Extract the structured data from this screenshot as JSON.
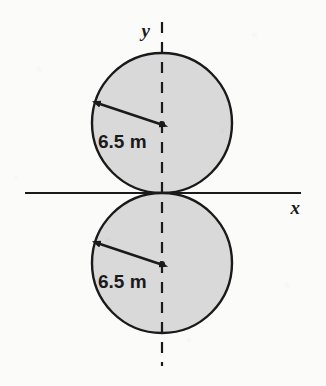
{
  "figure": {
    "background_color": "#fbfbfa",
    "stroke_color": "#1a1a1a",
    "fill_color": "#d9d9d9",
    "axes": {
      "x_label": "x",
      "y_label": "y",
      "x_axis": {
        "x1": 25,
        "y1": 193,
        "x2": 301,
        "y2": 193,
        "style": "solid"
      },
      "y_axis": {
        "x1": 162,
        "y1": 22,
        "x2": 162,
        "y2": 366,
        "style": "dashed"
      },
      "x_label_pos": {
        "x": 300,
        "y": 214
      },
      "y_label_pos": {
        "x": 150,
        "y": 37
      }
    },
    "circles": [
      {
        "id": "upper-circle",
        "cx": 162,
        "cy": 123,
        "r": 70,
        "radius_label": "6.5 m",
        "label_pos": {
          "x": 98,
          "y": 148
        },
        "arrow": {
          "x1": 100,
          "y1": 104,
          "x2": 160,
          "y2": 124
        }
      },
      {
        "id": "lower-circle",
        "cx": 162,
        "cy": 263,
        "r": 70,
        "radius_label": "6.5 m",
        "label_pos": {
          "x": 98,
          "y": 288
        },
        "arrow": {
          "x1": 100,
          "y1": 244,
          "x2": 160,
          "y2": 264
        }
      }
    ],
    "origin": {
      "x": 162,
      "y": 193
    }
  }
}
